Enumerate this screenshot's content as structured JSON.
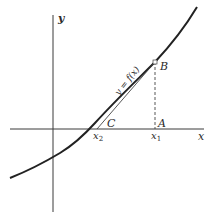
{
  "diagram": {
    "type": "function-graph-tangent",
    "axes": {
      "x_label": "x",
      "y_label": "y"
    },
    "curve": {
      "label": "y = f(x)"
    },
    "points": {
      "B": "B",
      "A": "A",
      "C": "C"
    },
    "x_ticks": {
      "x1": "x",
      "x1_sub": "1",
      "x2": "x",
      "x2_sub": "2"
    },
    "colors": {
      "ink": "#2a2a2a",
      "background": "#ffffff"
    }
  }
}
